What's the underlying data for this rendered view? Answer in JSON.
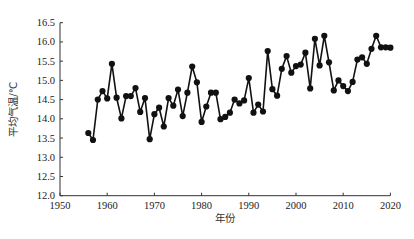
{
  "chart_data": {
    "type": "line",
    "title": "",
    "xlabel": "年份",
    "ylabel": "平均气温/℃",
    "xlim": [
      1950,
      2020
    ],
    "ylim": [
      12.0,
      16.5
    ],
    "xticks": [
      "1950",
      "1960",
      "1970",
      "1980",
      "1990",
      "2000",
      "2010",
      "2020"
    ],
    "yticks": [
      "12.0",
      "12.5",
      "13.0",
      "13.5",
      "14.0",
      "14.5",
      "15.0",
      "15.5",
      "16.0",
      "16.5"
    ],
    "grid": false,
    "legend": null,
    "marker": "circle",
    "color": "#111111",
    "series": [
      {
        "name": "平均气温",
        "x": [
          1956,
          1957,
          1958,
          1959,
          1960,
          1961,
          1962,
          1963,
          1964,
          1965,
          1966,
          1967,
          1968,
          1969,
          1970,
          1971,
          1972,
          1973,
          1974,
          1975,
          1976,
          1977,
          1978,
          1979,
          1980,
          1981,
          1982,
          1983,
          1984,
          1985,
          1986,
          1987,
          1988,
          1989,
          1990,
          1991,
          1992,
          1993,
          1994,
          1995,
          1996,
          1997,
          1998,
          1999,
          2000,
          2001,
          2002,
          2003,
          2004,
          2005,
          2006,
          2007,
          2008,
          2009,
          2010,
          2011,
          2012,
          2013,
          2014,
          2015,
          2016,
          2017,
          2018,
          2019,
          2020
        ],
        "values": [
          13.63,
          13.45,
          14.5,
          14.72,
          14.53,
          15.43,
          14.55,
          14.01,
          14.59,
          14.59,
          14.8,
          14.18,
          14.54,
          13.47,
          14.12,
          14.29,
          13.8,
          14.54,
          14.34,
          14.76,
          14.07,
          14.68,
          15.36,
          14.95,
          13.92,
          14.32,
          14.68,
          14.68,
          13.99,
          14.05,
          14.16,
          14.5,
          14.4,
          14.48,
          15.06,
          14.16,
          14.37,
          14.19,
          15.76,
          14.77,
          14.6,
          15.3,
          15.63,
          15.2,
          15.37,
          15.41,
          15.72,
          14.79,
          16.08,
          15.39,
          16.16,
          15.47,
          14.74,
          15.0,
          14.85,
          14.72,
          14.96,
          15.54,
          15.6,
          15.43,
          15.82,
          16.16,
          15.86,
          15.86,
          15.85
        ]
      }
    ]
  }
}
